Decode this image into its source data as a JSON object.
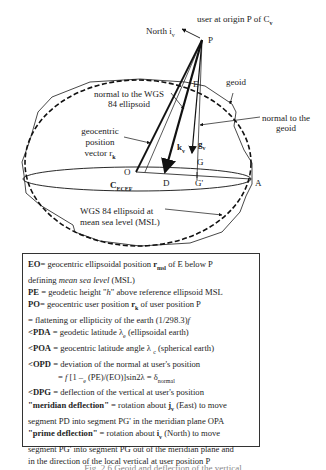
{
  "figure": {
    "labels": {
      "user_origin": "user at origin P of C",
      "user_origin_sub": "v",
      "north": "North i",
      "north_sub": "v",
      "point_P": "P",
      "point_E": "E",
      "geoid": "geoid",
      "normal_wgs84_line1": "normal to the WGS",
      "normal_wgs84_line2": "84 ellipsoid",
      "normal_geoid_line1": "normal to the",
      "normal_geoid_line2": "geoid",
      "geocentric_line1": "geocentric",
      "geocentric_line2": "position",
      "geocentric_line3": "vector r",
      "geocentric_sub": "k",
      "k_vector": "k",
      "k_sub": "v",
      "g_vector": "g",
      "g_sub": "v",
      "point_G": "G",
      "point_O": "O",
      "point_D": "D",
      "point_Gprime": "G'",
      "point_A": "A",
      "frame": "C",
      "frame_sub": "ECEF",
      "wgs84_msl_line1": "WGS 84 ellipsoid at",
      "wgs84_msl_line2": "mean sea  level (MSL)"
    }
  },
  "legend": {
    "lines": [
      {
        "b": "EO",
        "t": "= geocentric ellipsoidal position ",
        "v": "r",
        "vs": "msl",
        "t2": " of E below P"
      },
      {
        "t": "defining ",
        "i": "mean sea level",
        "t2": " (MSL)"
      },
      {
        "b": "PE",
        "t": " = geodetic height \"",
        "i": "h",
        "t2": "\" above reference ellipsoid MSL"
      },
      {
        "b": "PO",
        "t": "= geocentric user position ",
        "v": "r",
        "vs": "k",
        "t2": " of user position P"
      },
      {
        "i": "f",
        "t": " = flattening or ellipticity of the earth (1/298.3)"
      },
      {
        "b": "<PDA",
        "t": " = geodetic latitude λ",
        "s": "e",
        "t2": " (ellipsoidal earth)"
      },
      {
        "b": "<POA",
        "t": " = geocentric latitude angle λ",
        "s": "c",
        "t2": "  (spherical earth)"
      },
      {
        "b": "<OPD",
        "t": " = deviation of the normal at user's position"
      },
      {
        "ind": true,
        "t": "= ",
        "i": "f",
        "t2": " [1 – (PE)/(EO)]sin2λ",
        "s": "e",
        "t3": " = δ",
        "s2": "normal"
      },
      {
        "b": "<DPG",
        "t": " = deflection of the vertical at user's position"
      },
      {
        "b": "\"meridian deflection\"",
        "t": " = rotation about ",
        "v": "j",
        "vs": "v",
        "t2": " (East) to move"
      },
      {
        "t": "segment PD into segment PG' in the meridian plane OPA"
      },
      {
        "b": "\"prime deflection\"",
        "t": " = rotation about ",
        "v": "i",
        "vs": "v",
        "t2": " (North) to move"
      },
      {
        "t": "segment PG' into segment PG out of the meridian plane and"
      },
      {
        "t": "in the direction of the local vertical at user position P"
      }
    ]
  },
  "caption": "Fig. 2.6   Geoid and deflection of the vertical"
}
